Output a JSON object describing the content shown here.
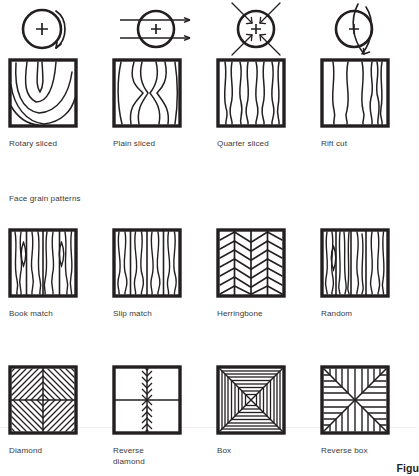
{
  "figure": {
    "caption_partial": "Figu",
    "section_label": "Face grain patterns"
  },
  "cut_methods": {
    "row_label": "Veneer cutting methods",
    "items": [
      {
        "label": "Rotary sliced",
        "log_icon": "log-rotary-arc-icon",
        "panel_icon": "veneer-rotary-cathedral-icon",
        "grain_description": "nested U-shaped cathedral arcs",
        "cut_geometry": "tangential spiral peel around full circumference"
      },
      {
        "label": "Plain sliced",
        "log_icon": "log-plain-parallel-arrows-icon",
        "panel_icon": "veneer-plain-x-figure-icon",
        "grain_description": "X-shaped crotch cathedral figure",
        "cut_geometry": "parallel horizontal slices across the log"
      },
      {
        "label": "Quarter sliced",
        "log_icon": "log-quarter-radial-arrows-icon",
        "panel_icon": "veneer-quarter-straight-grain-icon",
        "grain_description": "close evenly spaced vertical stripe grain",
        "cut_geometry": "four radial cuts toward the pith"
      },
      {
        "label": "Rift cut",
        "log_icon": "log-rift-offset-arc-icon",
        "panel_icon": "veneer-rift-straight-grain-icon",
        "grain_description": "wide straight grain tightening to one side",
        "cut_geometry": "offset arcs slightly off the radius"
      }
    ]
  },
  "face_grain_patterns": {
    "items": [
      {
        "label": "Book match",
        "panel_icon": "pattern-book-match-icon",
        "description": "adjacent leaves mirrored producing lens shapes at the seams",
        "leaves": 4
      },
      {
        "label": "Slip match",
        "panel_icon": "pattern-slip-match-icon",
        "description": "leaves slid side by side repeating the same grain direction",
        "leaves": 4
      },
      {
        "label": "Herringbone",
        "panel_icon": "pattern-herringbone-icon",
        "description": "angled chevron grain meeting at vertical seams",
        "leaves": 4
      },
      {
        "label": "Random",
        "panel_icon": "pattern-random-icon",
        "description": "unmatched leaves of varying grain and width",
        "leaves": 4
      }
    ]
  },
  "geometric_patterns": {
    "items": [
      {
        "label": "Diamond",
        "panel_icon": "pattern-diamond-icon",
        "description": "four quadrants of diagonal grain forming concentric diamonds"
      },
      {
        "label": "Reverse\ndiamond",
        "panel_icon": "pattern-reverse-diamond-icon",
        "description": "diagonal grain radiating outward from the centre"
      },
      {
        "label": "Box",
        "panel_icon": "pattern-box-icon",
        "description": "concentric squares with mitred corner seams"
      },
      {
        "label": "Reverse box",
        "panel_icon": "pattern-reverse-box-icon",
        "description": "vertical grain top and bottom, horizontal grain at the sides"
      }
    ]
  },
  "colors": {
    "ink": "#231f20",
    "caption_ink": "#3a3a3c",
    "background": "#ffffff",
    "hairline": "#f2eff0"
  }
}
